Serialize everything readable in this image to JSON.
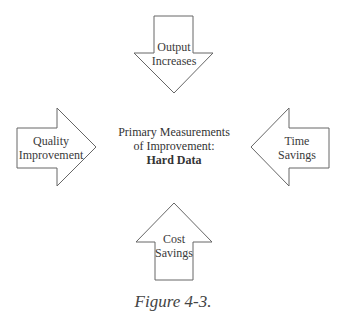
{
  "center": {
    "line1": "Primary Measurements",
    "line2": "of Improvement:",
    "bold": "Hard Data"
  },
  "arrows": [
    {
      "position": "top",
      "direction": "down",
      "line1": "Output",
      "line2": "Increases"
    },
    {
      "position": "left",
      "direction": "right",
      "line1": "Quality",
      "line2": "Improvement"
    },
    {
      "position": "right",
      "direction": "left",
      "line1": "Time",
      "line2": "Savings"
    },
    {
      "position": "bottom",
      "direction": "up",
      "line1": "Cost",
      "line2": "Savings"
    }
  ],
  "caption": "Figure 4-3.",
  "colors": {
    "stroke": "#555555",
    "fill": "#ffffff",
    "text": "#3a3a3a"
  }
}
